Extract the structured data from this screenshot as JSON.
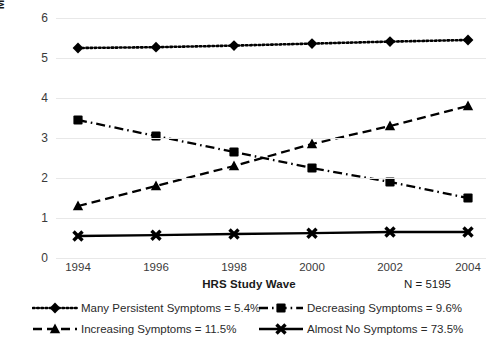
{
  "chart_data": {
    "type": "line",
    "title": "",
    "xlabel": "HRS Study Wave",
    "ylabel": "Mean # of Depressive Symptoms",
    "categories": [
      "1994",
      "1996",
      "1998",
      "2000",
      "2002",
      "2004"
    ],
    "x": [
      1994,
      1996,
      1998,
      2000,
      2002,
      2004
    ],
    "ylim": [
      0,
      6
    ],
    "yticks": [
      "0",
      "1",
      "2",
      "3",
      "4",
      "5",
      "6"
    ],
    "grid": true,
    "legend_position": "bottom",
    "annotation": "N = 5195",
    "series": [
      {
        "name": "Many Persistent Symptoms = 5.4%",
        "label": "Many Persistent Symptoms",
        "percent": "5.4%",
        "marker": "diamond",
        "linestyle": "dotted",
        "color": "#000000",
        "values": [
          5.25,
          5.27,
          5.31,
          5.36,
          5.41,
          5.45
        ]
      },
      {
        "name": "Decreasing Symptoms = 9.6%",
        "label": "Decreasing Symptoms",
        "percent": "9.6%",
        "marker": "square",
        "linestyle": "dashdot",
        "color": "#000000",
        "values": [
          3.45,
          3.05,
          2.65,
          2.25,
          1.9,
          1.5
        ]
      },
      {
        "name": "Increasing Symptoms = 11.5%",
        "label": "Increasing Symptoms",
        "percent": "11.5%",
        "marker": "triangle",
        "linestyle": "dashed",
        "color": "#000000",
        "values": [
          1.3,
          1.8,
          2.3,
          2.85,
          3.3,
          3.8
        ]
      },
      {
        "name": "Almost No Symptoms = 73.5%",
        "label": "Almost No Symptoms",
        "percent": "73.5%",
        "marker": "x",
        "linestyle": "solid",
        "color": "#000000",
        "values": [
          0.55,
          0.57,
          0.6,
          0.62,
          0.65,
          0.65
        ]
      }
    ]
  },
  "colors": {
    "ink": "#000000",
    "grid": "#e8e8e8",
    "text": "#3a3a3a"
  }
}
